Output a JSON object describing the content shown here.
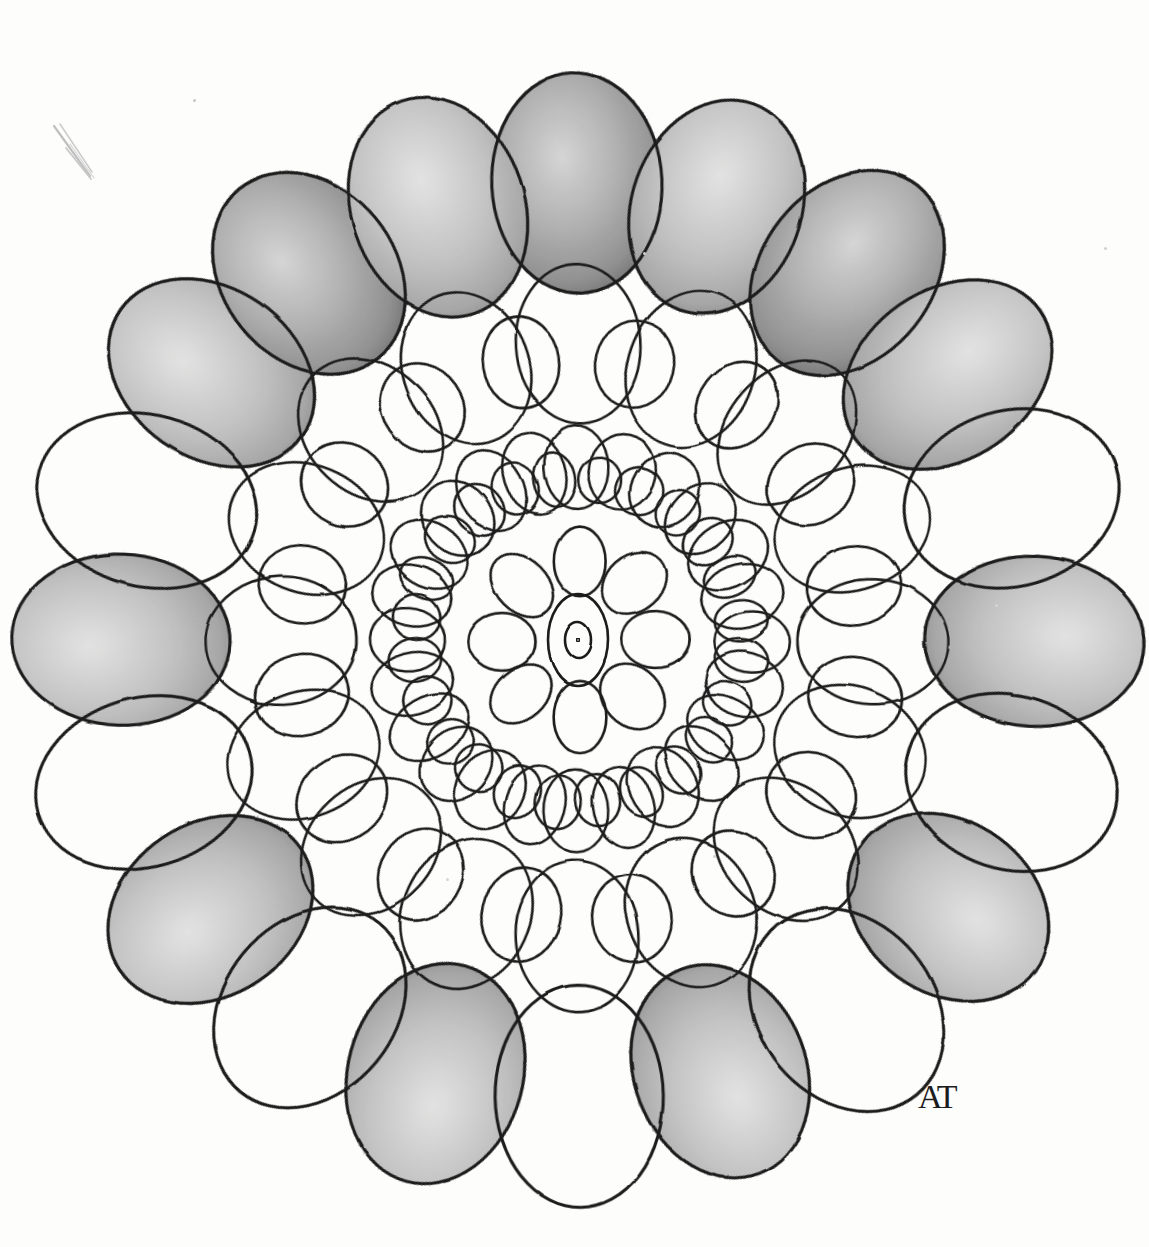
{
  "artwork": {
    "title": "Hand-drawn pencil mandala of concentric ellipse rings",
    "medium": "graphite pencil on white paper",
    "background_color": "#fdfdfc",
    "ink_color": "#1c1c1c",
    "shade_color": "#9a9a9a",
    "shade_edge_color": "#6f6f6f",
    "canvas": {
      "width": 1149,
      "height": 1247
    },
    "center": {
      "x": 578,
      "y": 640
    },
    "signature": {
      "text": "AT",
      "x": 918,
      "y": 1078,
      "font_size": 34,
      "label": "artist-monogram"
    },
    "stray_mark": {
      "label": "stray-pencil-stroke",
      "x": 46,
      "y": 120,
      "width": 70,
      "height": 70,
      "color": "#c3c3c3"
    },
    "specks": [
      {
        "x": 193,
        "y": 99,
        "size": 3,
        "color": "#c6c6c6"
      },
      {
        "x": 643,
        "y": 252,
        "size": 3,
        "color": "#cfcfcf"
      },
      {
        "x": 1104,
        "y": 247,
        "size": 3,
        "color": "#cfcfcf"
      },
      {
        "x": 713,
        "y": 855,
        "size": 3,
        "color": "#d2d2d2"
      },
      {
        "x": 446,
        "y": 878,
        "size": 3,
        "color": "#d6d6d6"
      },
      {
        "x": 995,
        "y": 604,
        "size": 3,
        "color": "#d6d6d6"
      }
    ],
    "rings": [
      {
        "name": "outer-ring",
        "label": "Outer ring of 20 large shaded and unshaded ellipses",
        "count": 20,
        "radius": 455,
        "rx": 86,
        "ry": 110,
        "stroke_width": 3.1,
        "start_angle": -90,
        "shaded_indices": [
          0,
          1,
          2,
          18,
          19,
          17,
          15,
          13,
          11,
          9,
          7,
          5,
          3
        ],
        "shade_pattern": "alternating with a run of adjacent shaded lobes across the top"
      },
      {
        "name": "middle-ring-large",
        "label": "Middle ring of 16 large open ellipses",
        "count": 16,
        "radius": 295,
        "rx": 62,
        "ry": 78,
        "stroke_width": 2.6,
        "start_angle": -90,
        "shaded_indices": []
      },
      {
        "name": "middle-ring-small",
        "label": "Middle ring of 16 smaller ellipses interleaved in the overlaps",
        "count": 16,
        "radius": 282,
        "rx": 40,
        "ry": 46,
        "stroke_width": 2.6,
        "start_angle": -78.75,
        "shaded_indices": []
      },
      {
        "name": "inner-ring-large",
        "label": "Inner ring of 24 small open ellipses",
        "count": 24,
        "radius": 172,
        "rx": 32,
        "ry": 40,
        "stroke_width": 2.5,
        "start_angle": -90,
        "shaded_indices": []
      },
      {
        "name": "inner-ring-small",
        "label": "Inner ring of 24 tiny ellipses nested in the overlaps",
        "count": 24,
        "radius": 163,
        "rx": 22,
        "ry": 25,
        "stroke_width": 2.5,
        "start_angle": -82.5,
        "shaded_indices": []
      },
      {
        "name": "petal-ring",
        "label": "Rosette of 8 petal ellipses around the core",
        "count": 8,
        "radius": 78,
        "rx": 27,
        "ry": 36,
        "stroke_width": 2.6,
        "start_angle": -90,
        "shaded_indices": []
      }
    ],
    "core": [
      {
        "name": "core-outer-ellipse",
        "rx": 30,
        "ry": 46,
        "stroke_width": 2.6
      },
      {
        "name": "core-inner-ellipse",
        "rx": 13,
        "ry": 18,
        "stroke_width": 2.6
      },
      {
        "name": "core-dot",
        "rx": 1.6,
        "ry": 1.6,
        "stroke_width": 1.6
      }
    ]
  }
}
